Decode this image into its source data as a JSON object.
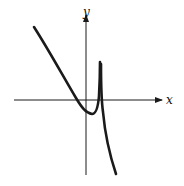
{
  "figure": {
    "type": "function-graph",
    "axes": {
      "x_label": "x",
      "y_label": "y",
      "color": "#1a1a1a"
    },
    "curve": {
      "color": "#1a1a1a",
      "features": [
        "decreasing left branch",
        "local minimum just right of y-axis",
        "vertical asymptote right of y-axis",
        "right branch decreasing to -infinity"
      ]
    }
  }
}
